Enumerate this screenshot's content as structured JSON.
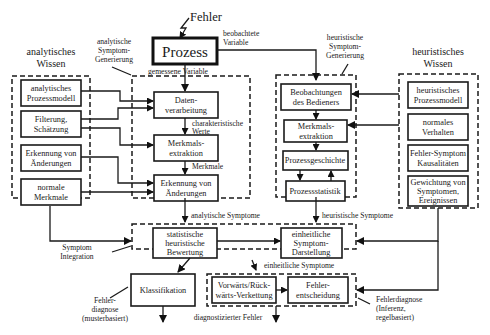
{
  "diagram": {
    "top": {
      "fault_input": "Fehler",
      "process": "Prozess",
      "observed_variable": [
        "beobachtete",
        "Variable"
      ],
      "measured_variable": "gemessene Variable"
    },
    "groups": {
      "analytic_knowledge": {
        "title": [
          "analytisches",
          "Wissen"
        ],
        "items": [
          [
            "analytisches",
            "Prozessmodell"
          ],
          [
            "Filterung,",
            "Schätzung"
          ],
          [
            "Erkennung von",
            "Änderungen"
          ],
          [
            "normale",
            "Merkmale"
          ]
        ]
      },
      "analytic_symptom_generation": {
        "title": [
          "analytische",
          "Symptom-",
          "Generierung"
        ],
        "items": [
          [
            "Daten-",
            "verarbeitung"
          ],
          [
            "Merkmals-",
            "extraktion"
          ],
          [
            "Erkennung von",
            "Änderungen"
          ]
        ],
        "edge_labels": {
          "characteristic_values": [
            "charakteristische",
            "Werte"
          ],
          "features": "Merkmale"
        }
      },
      "heuristic_symptom_generation": {
        "title": [
          "heuristische",
          "Symptom-",
          "Generierung"
        ],
        "items": [
          [
            "Beobachtungen",
            "des Bedieners"
          ],
          [
            "Merkmals-",
            "extraktion"
          ],
          [
            "Prozessgeschichte"
          ],
          [
            "Prozessstatistik"
          ]
        ]
      },
      "heuristic_knowledge": {
        "title": [
          "heuristisches",
          "Wissen"
        ],
        "items": [
          [
            "heuristisches",
            "Prozessmodell"
          ],
          [
            "normales",
            "Verhalten"
          ],
          [
            "Fehler-Symptom",
            "Kausalitäten"
          ],
          [
            "Gewichtung von",
            "Symptomen,",
            "Ereignissen"
          ]
        ]
      },
      "symptom_integration": {
        "title": [
          "Symptom",
          "Integration"
        ],
        "items": [
          [
            "statistische",
            "heuristische",
            "Bewertung"
          ],
          [
            "einheitliche",
            "Symptom-",
            "Darstellung"
          ]
        ]
      },
      "classification": {
        "label": "Klassifikation",
        "caption": [
          "Fehler-",
          "diagnose",
          "(musterbasiert)"
        ]
      },
      "inference": {
        "items": [
          [
            "Vorwärts/Rück-",
            "wärts-Verkettung"
          ],
          [
            "Fehler-",
            "entscheidung"
          ]
        ],
        "caption": [
          "Fehlerdiagnose",
          "(Inferenz,",
          "regelbasiert)"
        ]
      }
    },
    "flow_labels": {
      "analytic_symptoms": "analytische Symptome",
      "heuristic_symptoms": "heuristische Symptome",
      "unified_symptoms": "einheitliche Symptome",
      "diagnosed_fault": "diagnostizierter Fehler"
    },
    "colors": {
      "stroke": "#1a1a1a",
      "background": "#ffffff"
    }
  }
}
